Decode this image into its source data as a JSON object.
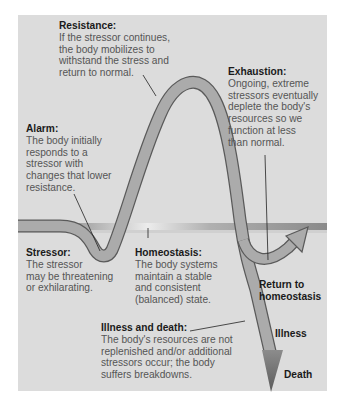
{
  "diagram": {
    "type": "general-adaptation-syndrome-curve",
    "colors": {
      "panel_bg": "#dcdcdc",
      "band_dark": "#9a9a9a",
      "band_light": "#e6e6e6",
      "curve_fill": "#a9a9a9",
      "curve_stroke": "#5a5a5a",
      "arrow_dark": "#6e6e6e"
    },
    "stages": {
      "resistance": {
        "title": "Resistance:",
        "text": "If the stressor continues,\nthe body mobilizes to\nwithstand the stress and\nreturn to normal."
      },
      "exhaustion": {
        "title": "Exhaustion:",
        "text": "Ongoing, extreme\nstressors eventually\ndeplete the body's\nresources so we\nfunction at less\nthan normal."
      },
      "alarm": {
        "title": "Alarm:",
        "text": "The body initially\nresponds to a\nstressor with\nchanges that lower\nresistance."
      },
      "stressor": {
        "title": "Stressor:",
        "text": "The stressor\nmay be threatening\nor exhilarating."
      },
      "homeostasis": {
        "title": "Homeostasis:",
        "text": "The body systems\nmaintain a stable\nand consistent\n(balanced) state."
      },
      "illness_death": {
        "title": "Illness and death:",
        "text": "The body's resources are not\nreplenished and/or additional\nstressors occur; the body\nsuffers breakdowns."
      }
    },
    "outcomes": {
      "return": "Return to\nhomeostasis",
      "illness": "Illness",
      "death": "Death"
    }
  }
}
